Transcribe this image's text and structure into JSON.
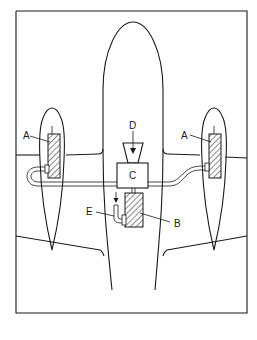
{
  "diagram": {
    "type": "aircraft-system-schematic",
    "view": "top",
    "labels": {
      "A_left": "A",
      "A_right": "A",
      "B": "B",
      "C": "C",
      "D": "D",
      "E": "E"
    },
    "components": [
      {
        "id": "A",
        "description": "hatched units inside each engine nacelle (left and right)"
      },
      {
        "id": "B",
        "description": "hatched unit in fuselage below C"
      },
      {
        "id": "C",
        "description": "central box connected by lines to both A units"
      },
      {
        "id": "D",
        "description": "intake funnel with downward arrow feeding C"
      },
      {
        "id": "E",
        "description": "small bent pipe with downward arrow attached to B"
      }
    ],
    "colors": {
      "line": "#1a1a1a",
      "background": "#ffffff"
    }
  }
}
